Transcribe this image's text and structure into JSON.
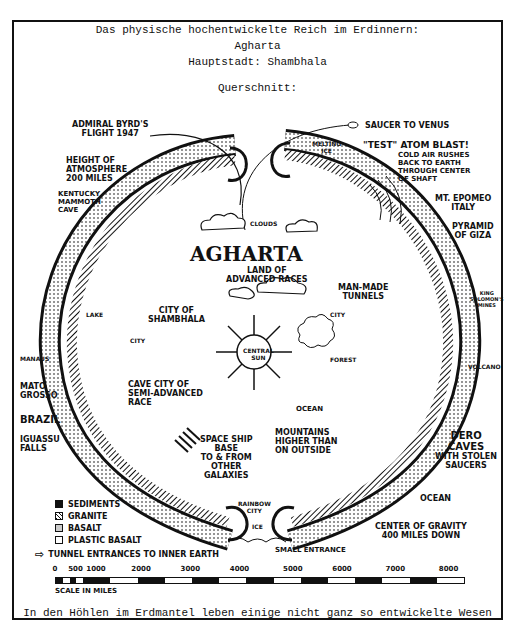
{
  "header": {
    "line1": "Das physische hochentwickelte Reich im Erdinnern:",
    "line2": "Agharta",
    "line3": "Hauptstadt:  Shambhala",
    "line4": "Querschnitt:"
  },
  "diagram": {
    "title": "AGHARTA",
    "subtitle": "LAND OF\nADVANCED RACES",
    "labels": {
      "byrd": "ADMIRAL BYRD'S\nFLIGHT 1947",
      "atmosphere": "HEIGHT OF\nATMOSPHERE\n200 MILES",
      "kentucky": "KENTUCKY\nMAMMOTH\nCAVE",
      "saucer": "SAUCER TO VENUS",
      "melting_ice": "MELTING\nICE",
      "atom_blast": "\"TEST\" ATOM BLAST!",
      "cold_air": "COLD AIR RUSHES\nBACK TO EARTH\nTHROUGH CENTER\nOF SHAFT",
      "epomeo": "MT. EPOMEO\nITALY",
      "giza": "PYRAMID\nOF GIZA",
      "clouds": "CLOUDS",
      "shambhala": "CITY OF\nSHAMBHALA",
      "city_left": "CITY",
      "lake": "LAKE",
      "central_sun": "CENTRAL\nSUN",
      "tunnels": "MAN-MADE\nTUNNELS",
      "city_right": "CITY",
      "forest": "FOREST",
      "solomon": "KING\nSOLOMON'S\nMINES",
      "volcano": "VOLCANO",
      "manaus": "MANAUS",
      "mato_grosso": "MATO\nGROSSO",
      "cave_city": "CAVE CITY OF\nSEMI-ADVANCED\nRACE",
      "ocean_inner": "OCEAN",
      "brazil": "BRAZIL",
      "iguassu": "IGUASSU\nFALLS",
      "spaceship": "SPACE SHIP\nBASE\nTO & FROM\nOTHER\nGALAXIES",
      "mountains": "MOUNTAINS\nHIGHER THAN\nON OUTSIDE",
      "dero": "DERO\nCAVES",
      "stolen": "WITH STOLEN\nSAUCERS",
      "ocean_outer": "OCEAN",
      "rainbow": "RAINBOW\nCITY",
      "ice": "ICE",
      "small_entrance": "SMALL ENTRANCE",
      "gravity": "CENTER OF GRAVITY\n400 MILES DOWN"
    }
  },
  "legend": {
    "items": [
      {
        "label": "SEDIMENTS",
        "fill": "#111111"
      },
      {
        "label": "GRANITE",
        "fill": "#888888"
      },
      {
        "label": "BASALT",
        "fill": "#cccccc"
      },
      {
        "label": "PLASTIC BASALT",
        "fill": "#ffffff"
      }
    ],
    "tunnel": "TUNNEL ENTRANCES TO INNER EARTH"
  },
  "scale": {
    "ticks": [
      "0",
      "500",
      "1000",
      "2000",
      "3000",
      "4000",
      "5000",
      "6000",
      "7000",
      "8000"
    ],
    "caption": "SCALE IN MILES"
  },
  "footer": "In den Höhlen im Erdmantel leben einige nicht ganz so entwickelte Wesen"
}
